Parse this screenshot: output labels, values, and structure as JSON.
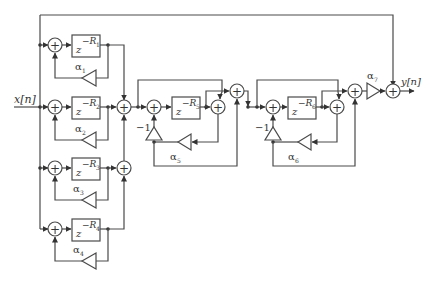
{
  "diagram": {
    "input_label": "x[n]",
    "output_label": "y[n]",
    "comb_filters": [
      {
        "delay": "z",
        "exponent": "−R",
        "sub": "1",
        "gain_label": "α",
        "gain_sub": "1"
      },
      {
        "delay": "z",
        "exponent": "−R",
        "sub": "2",
        "gain_label": "α",
        "gain_sub": "2"
      },
      {
        "delay": "z",
        "exponent": "−R",
        "sub": "3",
        "gain_label": "α",
        "gain_sub": "3"
      },
      {
        "delay": "z",
        "exponent": "−R",
        "sub": "4",
        "gain_label": "α",
        "gain_sub": "4"
      }
    ],
    "allpass_filters": [
      {
        "delay": "z",
        "exponent": "−R",
        "sub": "5",
        "gain_label": "α",
        "gain_sub": "5",
        "neg_gain": "−1"
      },
      {
        "delay": "z",
        "exponent": "−R",
        "sub": "6",
        "gain_label": "α",
        "gain_sub": "6",
        "neg_gain": "−1"
      }
    ],
    "output_gain": {
      "label": "α",
      "sub": "7"
    },
    "sum_symbol": "+"
  }
}
